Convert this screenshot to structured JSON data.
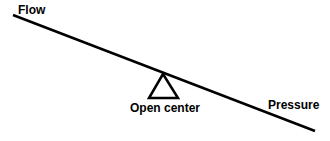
{
  "diagram": {
    "labels": {
      "flow": "Flow",
      "open_center": "Open center",
      "pressure": "Pressure"
    },
    "lever": {
      "x1": 13,
      "y1": 15,
      "x2": 315,
      "y2": 131,
      "color": "#000000"
    },
    "fulcrum": {
      "apex": [
        163,
        74
      ],
      "base_left": [
        149,
        98
      ],
      "base_right": [
        178,
        98
      ]
    }
  }
}
